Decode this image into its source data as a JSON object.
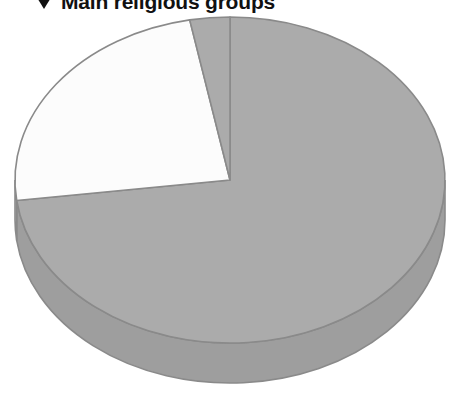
{
  "header": {
    "expander_icon": "triangle-down-icon",
    "title": "Main religious groups"
  },
  "chart_data": {
    "type": "pie",
    "title": "Main religious groups",
    "three_d": true,
    "legend": "none",
    "grid": false,
    "xlabel": "",
    "ylabel": "",
    "labels": [
      "Group A",
      "Group B",
      "Group C"
    ],
    "values": [
      73,
      24,
      3
    ],
    "colors": [
      "#ABABAB",
      "#FCFCFC",
      "#ABABAB"
    ],
    "start_angle_deg": 0,
    "direction": "clockwise",
    "series": [
      {
        "name": "Main religious groups",
        "values": [
          73,
          24,
          3
        ]
      }
    ],
    "style": {
      "slice_gray": "#ABABAB",
      "slice_white": "#FCFCFC",
      "wall_gray": "#9E9E9E",
      "wall_white": "#E9E9E9",
      "outline": "#8A8A8A",
      "background": "#FFFFFF"
    },
    "geometry": {
      "center_x": 230,
      "center_y": 180,
      "radius_x": 215,
      "radius_y": 163,
      "depth": 40
    }
  }
}
